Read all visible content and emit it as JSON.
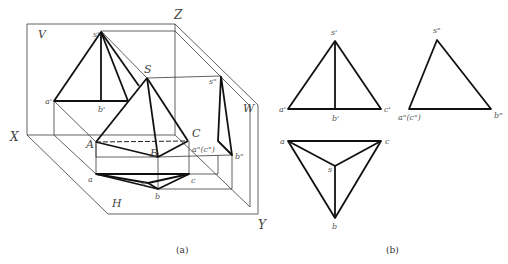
{
  "figure_a": {
    "caption": "(a)",
    "axes": {
      "x": "X",
      "y": "Y",
      "z": "Z"
    },
    "planes": {
      "v": "V",
      "h": "H",
      "w": "W"
    },
    "space_points": {
      "S": "S",
      "A": "A",
      "B": "B",
      "C": "C"
    },
    "front_labels": {
      "s": "s'",
      "a": "a'",
      "b": "b'"
    },
    "side_labels": {
      "s": "s\"",
      "ac": "a\"(c\")",
      "b": "b\""
    },
    "top_labels": {
      "a": "a",
      "b": "b",
      "c": "c",
      "s": "s"
    }
  },
  "figure_b": {
    "caption": "(b)",
    "front_view": {
      "s": "s'",
      "a": "a'",
      "b": "b'",
      "c": "c'"
    },
    "side_view": {
      "s": "s\"",
      "ac": "a\"(c\")",
      "b": "b\""
    },
    "top_view": {
      "a": "a",
      "c": "c",
      "s": "s",
      "b": "b"
    }
  }
}
